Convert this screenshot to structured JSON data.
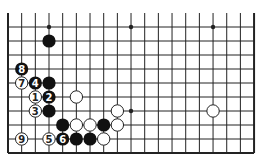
{
  "board": {
    "cols": 19,
    "rows": 10,
    "origin_x": 8,
    "origin_y": 27,
    "dx": 13.67,
    "dy": 14,
    "top_open": true,
    "line_color": "#222222",
    "stars": [
      [
        3,
        0
      ],
      [
        9,
        0
      ],
      [
        15,
        0
      ],
      [
        9,
        6
      ]
    ]
  },
  "stones": [
    {
      "c": 3,
      "r": 1,
      "color": "black",
      "label": ""
    },
    {
      "c": 1,
      "r": 3,
      "color": "black",
      "label": "8"
    },
    {
      "c": 1,
      "r": 4,
      "color": "white",
      "label": "7"
    },
    {
      "c": 2,
      "r": 4,
      "color": "black",
      "label": "4"
    },
    {
      "c": 3,
      "r": 4,
      "color": "black",
      "label": ""
    },
    {
      "c": 2,
      "r": 5,
      "color": "white",
      "label": "1"
    },
    {
      "c": 3,
      "r": 5,
      "color": "black",
      "label": "2"
    },
    {
      "c": 5,
      "r": 5,
      "color": "white",
      "label": ""
    },
    {
      "c": 2,
      "r": 6,
      "color": "white",
      "label": "3"
    },
    {
      "c": 3,
      "r": 6,
      "color": "black",
      "label": ""
    },
    {
      "c": 8,
      "r": 6,
      "color": "white",
      "label": ""
    },
    {
      "c": 15,
      "r": 6,
      "color": "white",
      "label": ""
    },
    {
      "c": 4,
      "r": 7,
      "color": "black",
      "label": ""
    },
    {
      "c": 5,
      "r": 7,
      "color": "white",
      "label": ""
    },
    {
      "c": 6,
      "r": 7,
      "color": "white",
      "label": ""
    },
    {
      "c": 7,
      "r": 7,
      "color": "black",
      "label": ""
    },
    {
      "c": 8,
      "r": 7,
      "color": "white",
      "label": ""
    },
    {
      "c": 1,
      "r": 8,
      "color": "white",
      "label": "9"
    },
    {
      "c": 3,
      "r": 8,
      "color": "white",
      "label": "5"
    },
    {
      "c": 4,
      "r": 8,
      "color": "black",
      "label": "6"
    },
    {
      "c": 5,
      "r": 8,
      "color": "black",
      "label": ""
    },
    {
      "c": 6,
      "r": 8,
      "color": "black",
      "label": ""
    },
    {
      "c": 7,
      "r": 8,
      "color": "white",
      "label": ""
    }
  ]
}
